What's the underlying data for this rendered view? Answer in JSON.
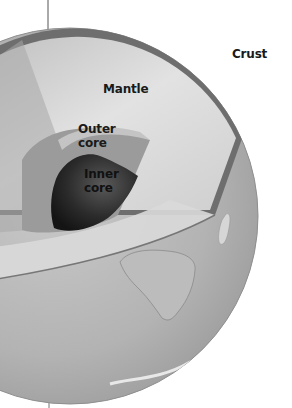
{
  "diagram": {
    "labels": {
      "crust": "Crust",
      "mantle": "Mantle",
      "outer_core_line1": "Outer",
      "outer_core_line2": "core",
      "inner_core_line1": "Inner",
      "inner_core_line2": "core"
    },
    "colors": {
      "background": "#ffffff",
      "globe_surface": "#b8b8b8",
      "crust_band": "#6e6e6e",
      "mantle": "#d4d4d4",
      "outer_core": "#9a9a9a",
      "inner_core": "#2a2a2a",
      "continent": "#a9a9a9",
      "label_text": "#1a1a1a"
    }
  }
}
